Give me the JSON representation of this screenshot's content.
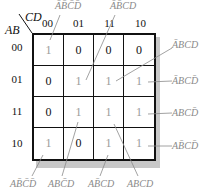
{
  "axis": {
    "row_var": "AB",
    "col_var": "CD"
  },
  "col_labels": [
    "00",
    "01",
    "11",
    "10"
  ],
  "row_labels": [
    "00",
    "01",
    "11",
    "10"
  ],
  "cells": [
    [
      "1",
      "0",
      "0",
      "0"
    ],
    [
      "0",
      "1",
      "1",
      "1"
    ],
    [
      "0",
      "1",
      "1",
      "1"
    ],
    [
      "1",
      "0",
      "1",
      "1"
    ]
  ],
  "colors": {
    "one": "#9a9a9a",
    "zero": "#111111",
    "annotation": "#8a8a8a",
    "shadow": "#c8c8c8"
  },
  "annotations": {
    "top": [
      {
        "text": "ĀB̄C̄D̄",
        "letters": [
          "A",
          "B",
          "C",
          "D"
        ],
        "overline": [
          true,
          true,
          true,
          true
        ],
        "target": "00-00"
      },
      {
        "text": "ĀB̄CD",
        "letters": [
          "A",
          "B",
          "C",
          "D"
        ],
        "overline": [
          true,
          true,
          false,
          false
        ],
        "target": "01-01"
      }
    ],
    "right": [
      {
        "text": "ĀBCD",
        "letters": [
          "A",
          "B",
          "C",
          "D"
        ],
        "overline": [
          true,
          false,
          false,
          false
        ],
        "target": "01-11"
      },
      {
        "text": "ĀBCD̄",
        "letters": [
          "A",
          "B",
          "C",
          "D"
        ],
        "overline": [
          true,
          false,
          false,
          true
        ],
        "target": "01-10"
      },
      {
        "text": "ABCD̄",
        "letters": [
          "A",
          "B",
          "C",
          "D"
        ],
        "overline": [
          false,
          false,
          false,
          true
        ],
        "target": "11-10"
      },
      {
        "text": "AB̄CD̄",
        "letters": [
          "A",
          "B",
          "C",
          "D"
        ],
        "overline": [
          false,
          true,
          false,
          true
        ],
        "target": "10-10"
      }
    ],
    "bottom": [
      {
        "text": "AB̄C̄D̄",
        "letters": [
          "A",
          "B",
          "C",
          "D"
        ],
        "overline": [
          false,
          true,
          true,
          true
        ],
        "target": "10-00"
      },
      {
        "text": "ABC̄D",
        "letters": [
          "A",
          "B",
          "C",
          "D"
        ],
        "overline": [
          false,
          false,
          true,
          false
        ],
        "target": "11-01"
      },
      {
        "text": "AB̄CD",
        "letters": [
          "A",
          "B",
          "C",
          "D"
        ],
        "overline": [
          false,
          true,
          false,
          false
        ],
        "target": "10-11"
      },
      {
        "text": "ABCD",
        "letters": [
          "A",
          "B",
          "C",
          "D"
        ],
        "overline": [
          false,
          false,
          false,
          false
        ],
        "target": "11-11"
      }
    ]
  }
}
